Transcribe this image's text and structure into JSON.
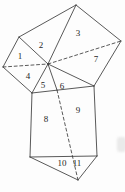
{
  "colors": {
    "background": "#fdfdfd",
    "line": "#3b3b3b",
    "label": "#1f1f1f",
    "artifact": "#eaeaea"
  },
  "diagram": {
    "type": "geometric-dissection-figure",
    "canvas": {
      "width": 125,
      "height": 192
    },
    "vertices": {
      "T": [
        76,
        5
      ],
      "L1": [
        19,
        37
      ],
      "R": [
        121,
        41
      ],
      "FL": [
        3,
        67
      ],
      "C": [
        48,
        64
      ],
      "A": [
        32,
        93
      ],
      "P": [
        57,
        90
      ],
      "B": [
        94,
        86
      ],
      "BL": [
        30,
        157
      ],
      "BR": [
        97,
        156
      ],
      "V": [
        78,
        180
      ]
    },
    "solid_edges": [
      [
        "L1",
        "T"
      ],
      [
        "T",
        "R"
      ],
      [
        "R",
        "B"
      ],
      [
        "FL",
        "L1"
      ],
      [
        "FL",
        "A"
      ],
      [
        "L1",
        "C"
      ],
      [
        "T",
        "C"
      ],
      [
        "C",
        "A"
      ],
      [
        "C",
        "P"
      ],
      [
        "C",
        "B"
      ],
      [
        "A",
        "B"
      ],
      [
        "A",
        "BL"
      ],
      [
        "B",
        "BR"
      ],
      [
        "BL",
        "BR"
      ],
      [
        "BL",
        "V"
      ],
      [
        "BR",
        "V"
      ]
    ],
    "dashed_edges": [
      [
        "FL",
        "C"
      ],
      [
        "C",
        "R"
      ],
      [
        "P",
        "V"
      ]
    ],
    "stroke_width": 0.85,
    "dash_pattern": "3 2.6",
    "region_labels": [
      {
        "text": "1",
        "x": 20,
        "y": 56
      },
      {
        "text": "2",
        "x": 41,
        "y": 45
      },
      {
        "text": "3",
        "x": 78,
        "y": 33
      },
      {
        "text": "4",
        "x": 28,
        "y": 76
      },
      {
        "text": "5",
        "x": 43,
        "y": 85
      },
      {
        "text": "6",
        "x": 62,
        "y": 86
      },
      {
        "text": "7",
        "x": 96,
        "y": 59
      },
      {
        "text": "8",
        "x": 46,
        "y": 119
      },
      {
        "text": "9",
        "x": 78,
        "y": 110
      },
      {
        "text": "10",
        "x": 62,
        "y": 163
      },
      {
        "text": "11",
        "x": 77,
        "y": 163
      }
    ],
    "scan_artifacts": [
      {
        "x": 117,
        "y": 137,
        "width": 9,
        "height": 15
      }
    ]
  }
}
